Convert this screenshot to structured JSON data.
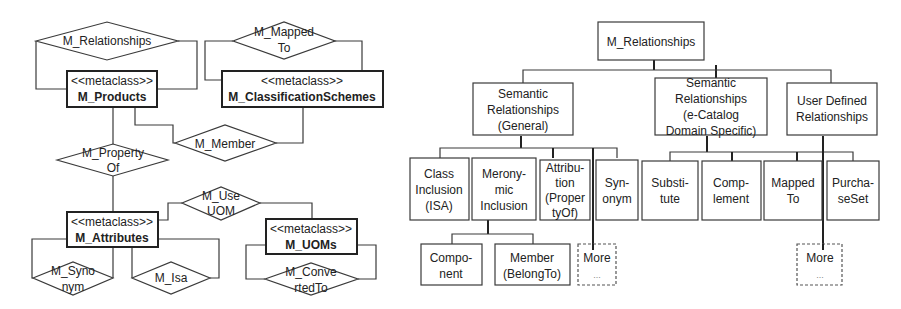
{
  "left_diagram": {
    "classes": [
      {
        "id": "products",
        "stereotype": "<<metaclass>>",
        "name": "M_Products"
      },
      {
        "id": "classification",
        "stereotype": "<<metaclass>>",
        "name": "M_ClassificationSchemes"
      },
      {
        "id": "attributes",
        "stereotype": "<<metaclass>>",
        "name": "M_Attributes"
      },
      {
        "id": "uoms",
        "stereotype": "<<metaclass>>",
        "name": "M_UOMs"
      }
    ],
    "relationships": [
      {
        "id": "relationships",
        "lines": [
          "M_Relationships"
        ]
      },
      {
        "id": "mapped_to",
        "lines": [
          "M_Mapped",
          "To"
        ]
      },
      {
        "id": "member",
        "lines": [
          "M_Member"
        ]
      },
      {
        "id": "property_of",
        "lines": [
          "M_Property",
          "Of"
        ]
      },
      {
        "id": "use_uom",
        "lines": [
          "M_Use",
          "UOM"
        ]
      },
      {
        "id": "synonym",
        "lines": [
          "M_Syno",
          "nym"
        ]
      },
      {
        "id": "isa",
        "lines": [
          "M_Isa"
        ]
      },
      {
        "id": "converted_to",
        "lines": [
          "M_Conve",
          "rtedTo"
        ]
      }
    ]
  },
  "right_diagram": {
    "root": {
      "lines": [
        "M_Relationships"
      ]
    },
    "level2": [
      {
        "id": "general",
        "lines": [
          "Semantic",
          "Relationships",
          "(General)"
        ]
      },
      {
        "id": "ecatalog",
        "lines": [
          "Semantic",
          "Relationships",
          "(e-Catalog",
          "Domain Specific)"
        ]
      },
      {
        "id": "user",
        "lines": [
          "User Defined",
          "Relationships"
        ]
      }
    ],
    "level3_general": [
      {
        "id": "class_inclusion",
        "lines": [
          "Class",
          "Inclusion",
          "(ISA)"
        ]
      },
      {
        "id": "meronymic",
        "lines": [
          "Merony-",
          "mic",
          "Inclusion"
        ]
      },
      {
        "id": "attribution",
        "lines": [
          "Attribu-",
          "tion",
          "(Proper",
          "tyOf)"
        ]
      },
      {
        "id": "synonym",
        "lines": [
          "Syn-",
          "onym"
        ]
      }
    ],
    "level3_ecatalog": [
      {
        "id": "substitute",
        "lines": [
          "Substi-",
          "tute"
        ]
      },
      {
        "id": "complement",
        "lines": [
          "Comp-",
          "lement"
        ]
      },
      {
        "id": "mapped_to",
        "lines": [
          "Mapped",
          "To"
        ]
      },
      {
        "id": "purchase_set",
        "lines": [
          "Purcha-",
          "seSet"
        ]
      }
    ],
    "level4_meronymic": [
      {
        "id": "component",
        "lines": [
          "Compo-",
          "nent"
        ]
      },
      {
        "id": "member",
        "lines": [
          "Member",
          "(BelongTo)"
        ]
      }
    ],
    "more_general": {
      "lines": [
        "More",
        "..."
      ]
    },
    "more_user": {
      "lines": [
        "More",
        "..."
      ]
    }
  }
}
